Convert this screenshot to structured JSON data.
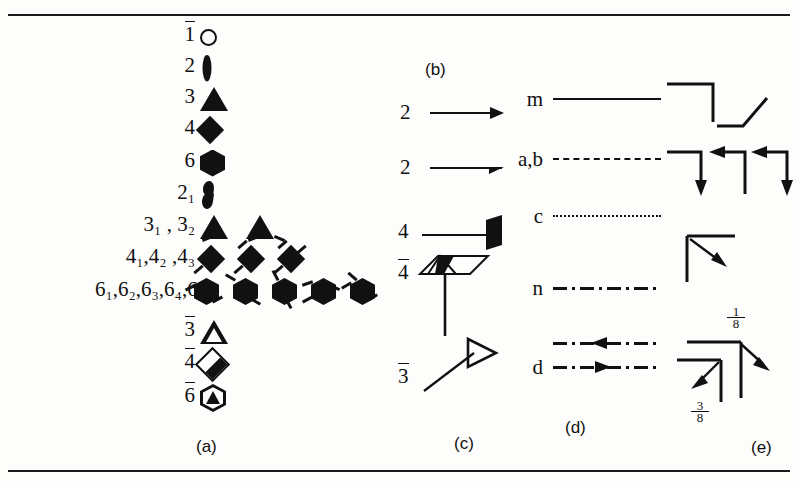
{
  "figure": {
    "type": "crystallographic-symmetry-symbols-legend",
    "background": "#fdfdfb",
    "ink": "#111111",
    "rules": {
      "top": "horizontal-rule",
      "bottom": "horizontal-rule"
    }
  },
  "panels": {
    "a": {
      "caption": "(a)",
      "title_note": "symmetry axes normal to the page",
      "rows": [
        {
          "label": "1",
          "overline": true,
          "symbols": [
            "open-circle"
          ]
        },
        {
          "label": "2",
          "overline": false,
          "symbols": [
            "filled-lens"
          ]
        },
        {
          "label": "3",
          "overline": false,
          "symbols": [
            "filled-triangle"
          ]
        },
        {
          "label": "4",
          "overline": false,
          "symbols": [
            "filled-diamond"
          ]
        },
        {
          "label": "6",
          "overline": false,
          "symbols": [
            "filled-hexagon"
          ]
        },
        {
          "label": "2₁",
          "overline": false,
          "symbols": [
            "filled-lens-with-tails"
          ]
        },
        {
          "label": "3₁ , 3₂",
          "overline": false,
          "symbols": [
            "triangle-screw-1",
            "triangle-screw-2"
          ]
        },
        {
          "label": "4₁,4₂ ,4₃",
          "overline": false,
          "symbols": [
            "diamond-screw-1",
            "diamond-screw-2",
            "diamond-screw-3"
          ]
        },
        {
          "label": "6₁,6₂,6₃,6₄,6₅",
          "overline": false,
          "symbols": [
            "hex-screw-1",
            "hex-screw-2",
            "hex-screw-3",
            "hex-screw-4",
            "hex-screw-5"
          ]
        },
        {
          "label": "3",
          "overline": true,
          "symbols": [
            "open-triangle"
          ]
        },
        {
          "label": "4",
          "overline": true,
          "symbols": [
            "half-filled-diamond"
          ]
        },
        {
          "label": "6",
          "overline": true,
          "symbols": [
            "hexagon-with-triangle"
          ]
        }
      ]
    },
    "b": {
      "caption": "(b)",
      "title_note": "symmetry axes in the plane of the page",
      "rows": [
        {
          "label": "2",
          "symbol": "full-arrow",
          "meaning": "two-fold rotation axis in plane"
        },
        {
          "label": "2",
          "symbol": "half-arrow",
          "meaning": "two-fold screw axis in plane"
        }
      ]
    },
    "c": {
      "caption": "(c)",
      "title_note": "symmetry axes inclined to the page",
      "rows": [
        {
          "label": "4",
          "overline": false,
          "symbol": "filled-parallelogram-on-stick"
        },
        {
          "label": "4",
          "overline": true,
          "symbol": "open-parallelogram-with-filled-lens-and-stem"
        },
        {
          "label": "3",
          "overline": true,
          "symbol": "open-arrowhead-on-inclined-line"
        }
      ]
    },
    "d": {
      "caption": "(d)",
      "title_note": "symmetry planes normal to the page",
      "rows": [
        {
          "label": "m",
          "line": "solid",
          "meaning": "mirror plane"
        },
        {
          "label": "a,b",
          "line": "dashed",
          "meaning": "axial glide plane in plane of page"
        },
        {
          "label": "c",
          "line": "dotted",
          "meaning": "axial glide plane normal to page"
        },
        {
          "label": "n",
          "line": "dash-dot",
          "meaning": "diagonal glide plane"
        },
        {
          "label": "d",
          "line": "dash-dot-arrow",
          "meaning": "diamond glide plane",
          "arrows": [
            "left",
            "right"
          ]
        }
      ]
    },
    "e": {
      "caption": "(e)",
      "title_note": "symmetry planes inclined to the page",
      "groups": [
        {
          "row": 1,
          "items": [
            "corner-plain-right-down",
            "bent-line-up-right"
          ]
        },
        {
          "row": 2,
          "items": [
            "corner-arrow-down",
            "corner-arrow-left",
            "corner-arrow-left-down"
          ]
        },
        {
          "row": 3,
          "items": [
            "corner-diagonal-arrow-inward"
          ]
        },
        {
          "row": 4,
          "items": [
            "corner-arrow-out-down-right",
            "corner-arrow-in-down-left"
          ],
          "fractions": [
            "1/8",
            "3/8"
          ]
        }
      ],
      "fraction_labels": [
        {
          "numerator": "1",
          "denominator": "8"
        },
        {
          "numerator": "3",
          "denominator": "8"
        }
      ]
    }
  }
}
